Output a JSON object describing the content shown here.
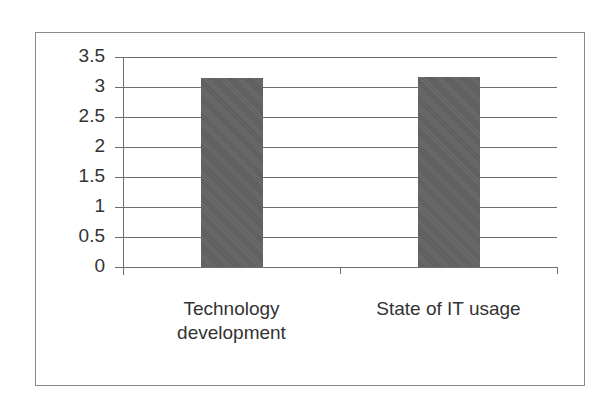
{
  "chart_data": {
    "type": "bar",
    "title": "",
    "xlabel": "",
    "ylabel": "",
    "categories": [
      "Technology development",
      "State of IT usage"
    ],
    "category_lines": [
      [
        "Technology",
        "development"
      ],
      [
        "State of IT usage"
      ]
    ],
    "values": [
      3.15,
      3.17
    ],
    "ylim": [
      0,
      3.5
    ],
    "yticks": [
      "0",
      "0.5",
      "1",
      "1.5",
      "2",
      "2.5",
      "3",
      "3.5"
    ],
    "grid": true,
    "legend": "none",
    "bar_color": "#5f5f5f"
  }
}
